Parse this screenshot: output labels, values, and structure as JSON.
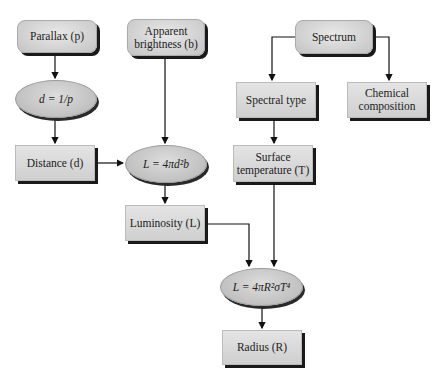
{
  "nodes": {
    "parallax": {
      "label": "Parallax (p)"
    },
    "apparent_brightness": {
      "line1": "Apparent",
      "line2": "brightness (b)"
    },
    "distance_formula": {
      "label": "d = 1/p"
    },
    "distance": {
      "label": "Distance (d)"
    },
    "luminosity_formula": {
      "label": "L = 4πd²b"
    },
    "luminosity": {
      "label": "Luminosity (L)"
    },
    "spectrum": {
      "label": "Spectrum"
    },
    "spectral_type": {
      "label": "Spectral type"
    },
    "chemical_composition": {
      "line1": "Chemical",
      "line2": "composition"
    },
    "surface_temperature": {
      "line1": "Surface",
      "line2": "temperature (T)"
    },
    "radius_formula": {
      "label": "L = 4πR²σT⁴"
    },
    "radius": {
      "label": "Radius (R)"
    }
  },
  "edges": [
    [
      "parallax",
      "distance_formula"
    ],
    [
      "distance_formula",
      "distance"
    ],
    [
      "distance",
      "luminosity_formula"
    ],
    [
      "apparent_brightness",
      "luminosity_formula"
    ],
    [
      "luminosity_formula",
      "luminosity"
    ],
    [
      "spectrum",
      "spectral_type"
    ],
    [
      "spectrum",
      "chemical_composition"
    ],
    [
      "spectral_type",
      "surface_temperature"
    ],
    [
      "luminosity",
      "radius_formula"
    ],
    [
      "surface_temperature",
      "radius_formula"
    ],
    [
      "radius_formula",
      "radius"
    ]
  ]
}
